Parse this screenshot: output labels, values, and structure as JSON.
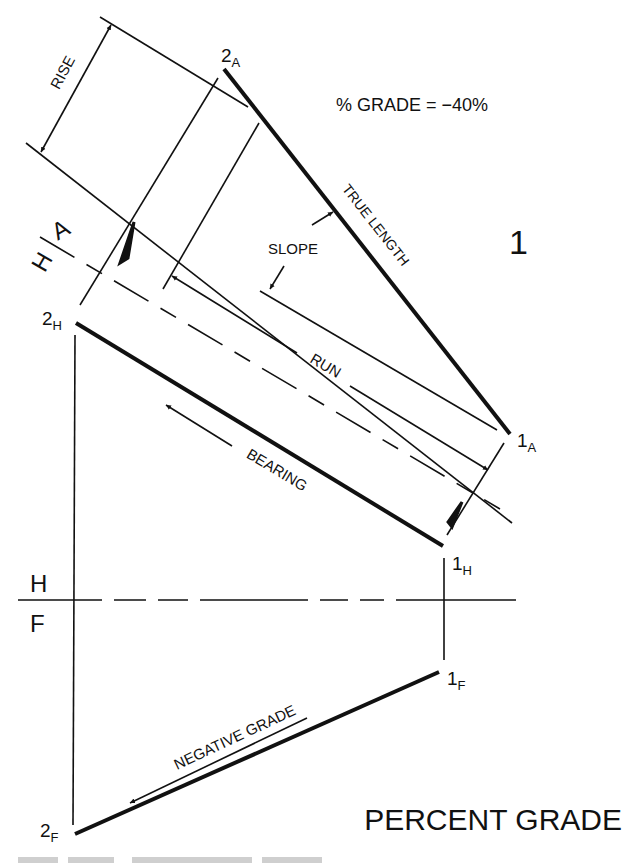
{
  "figure": {
    "title": "PERCENT GRADE",
    "view_number": "1",
    "grade_equation": "% GRADE = −40%",
    "ink_color": "#111111",
    "background": "#ffffff"
  },
  "labels": {
    "rise": "RISE",
    "slope": "SLOPE",
    "true_length": "TRUE LENGTH",
    "run": "RUN",
    "bearing": "BEARING",
    "negative_grade": "NEGATIVE GRADE"
  },
  "fold_lines": {
    "ah": {
      "upper": "A",
      "lower": "H"
    },
    "hf": {
      "upper": "H",
      "lower": "F"
    }
  },
  "points": {
    "p2A": {
      "num": "2",
      "sub": "A"
    },
    "p1A": {
      "num": "1",
      "sub": "A"
    },
    "p2H": {
      "num": "2",
      "sub": "H"
    },
    "p1H": {
      "num": "1",
      "sub": "H"
    },
    "p1F": {
      "num": "1",
      "sub": "F"
    },
    "p2F": {
      "num": "2",
      "sub": "F"
    }
  }
}
